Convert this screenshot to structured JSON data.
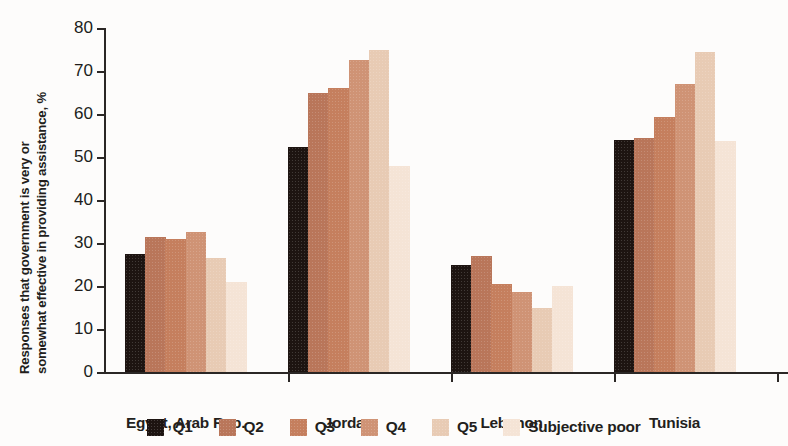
{
  "chart_data": {
    "type": "bar",
    "title": "",
    "subtitle": "",
    "xlabel": "",
    "ylabel": "Responses that government is very or somewhat effective in providing assistance, %",
    "ylabel_line1": "Responses that government is very or",
    "ylabel_line2": "somewhat effective in providing assistance, %",
    "categories": [
      "Egypt, Arab Rep.",
      "Jordan",
      "Lebanon",
      "Tunisia"
    ],
    "ylim": [
      0,
      80
    ],
    "yticks": [
      0,
      10,
      20,
      30,
      40,
      50,
      60,
      70,
      80
    ],
    "ytick_labels": [
      "0",
      "10",
      "20",
      "30",
      "40",
      "50",
      "60",
      "70",
      "80"
    ],
    "grid": false,
    "legend_position": "bottom",
    "series": [
      {
        "name": "Q1",
        "color": "#1d1411",
        "values": [
          27.5,
          52.3,
          25.0,
          54.0
        ]
      },
      {
        "name": "Q2",
        "color": "#b9765a",
        "values": [
          31.5,
          65.0,
          27.0,
          54.5
        ]
      },
      {
        "name": "Q3",
        "color": "#c57f5e",
        "values": [
          31.0,
          66.0,
          20.5,
          59.3
        ]
      },
      {
        "name": "Q4",
        "color": "#cf9375",
        "values": [
          32.5,
          72.5,
          18.7,
          67.0
        ]
      },
      {
        "name": "Q5",
        "color": "#e8cbb4",
        "values": [
          26.5,
          75.0,
          15.0,
          74.5
        ]
      },
      {
        "name": "Subjective poor",
        "color": "#f5e4d6",
        "values": [
          21.0,
          48.0,
          20.0,
          53.8
        ]
      }
    ]
  },
  "axis": {
    "y_axis_color": "#2b2725",
    "x_axis_color": "#2b2725"
  }
}
